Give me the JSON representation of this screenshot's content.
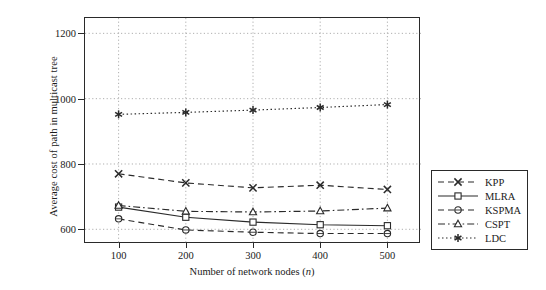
{
  "chart_data": {
    "type": "line",
    "title": "",
    "xlabel": "Number of network nodes (n)",
    "xlabel_main": "Number of network nodes (",
    "xlabel_italic": "n",
    "xlabel_tail": ")",
    "ylabel": "Average cost of path in multicast tree",
    "x": [
      100,
      200,
      300,
      400,
      500
    ],
    "xticklabels": [
      "100",
      "200",
      "300",
      "400",
      "500"
    ],
    "yticks": [
      600,
      800,
      1000,
      1200
    ],
    "yticklabels": [
      "600",
      "800",
      "1000",
      "1200"
    ],
    "xlim": [
      50,
      550
    ],
    "ylim": [
      555,
      1247
    ],
    "grid": "dotted-both",
    "legend_position": "right-outside",
    "series": [
      {
        "name": "KPP",
        "marker": "x-cross",
        "linestyle": "dashed",
        "color": "#2a2a2a",
        "values": [
          770,
          742,
          727,
          735,
          722
        ]
      },
      {
        "name": "MLRA",
        "marker": "square",
        "linestyle": "solid",
        "color": "#2a2a2a",
        "values": [
          668,
          637,
          622,
          614,
          611
        ]
      },
      {
        "name": "KSPMA",
        "marker": "circle",
        "linestyle": "dashed",
        "color": "#2a2a2a",
        "values": [
          632,
          598,
          591,
          587,
          587
        ]
      },
      {
        "name": "CSPT",
        "marker": "triangle",
        "linestyle": "dash-dot",
        "color": "#2a2a2a",
        "values": [
          673,
          655,
          653,
          656,
          665
        ]
      },
      {
        "name": "LDC",
        "marker": "asterisk",
        "linestyle": "dotted",
        "color": "#2a2a2a",
        "values": [
          952,
          958,
          965,
          973,
          982
        ]
      }
    ]
  }
}
